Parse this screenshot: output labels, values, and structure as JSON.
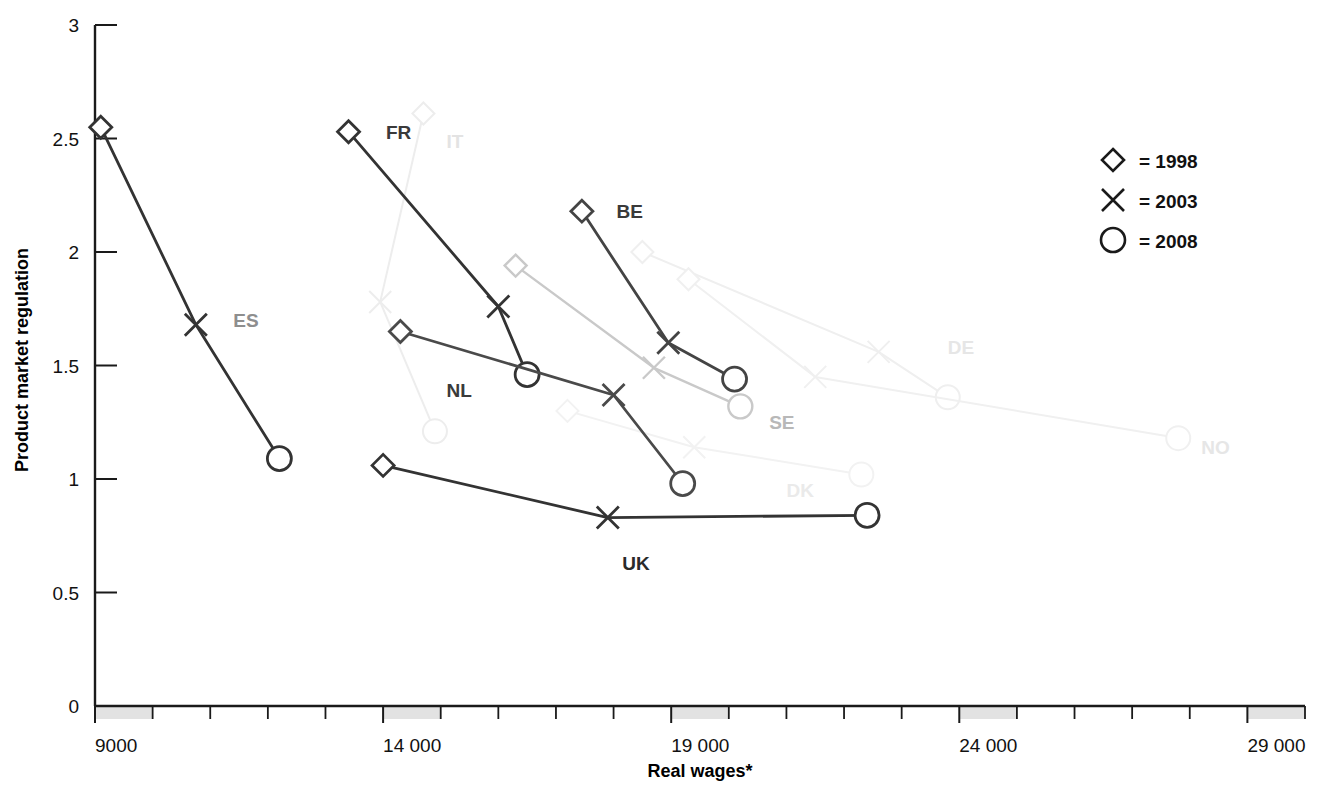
{
  "chart_data": {
    "type": "line",
    "title": "",
    "xlabel": "Real wages*",
    "ylabel": "Product market regulation",
    "xlim": [
      9000,
      30000
    ],
    "ylim": [
      0,
      3
    ],
    "x_ticks_major": [
      9000,
      14000,
      19000,
      24000,
      29000
    ],
    "x_tick_labels": [
      "9000",
      "14 000",
      "19 000",
      "24 000",
      "29 000"
    ],
    "x_tick_step_minor": 1000,
    "y_ticks": [
      0,
      0.5,
      1,
      1.5,
      2,
      2.5,
      3
    ],
    "y_tick_labels": [
      "0",
      "0.5",
      "1",
      "1.5",
      "2",
      "2.5",
      "3"
    ],
    "grid": false,
    "legend_position": "top-right",
    "legend": [
      {
        "marker": "diamond",
        "label": "= 1998"
      },
      {
        "marker": "cross",
        "label": "= 2003"
      },
      {
        "marker": "circle",
        "label": "= 2008"
      }
    ],
    "marker_years": [
      1998,
      2003,
      2008
    ],
    "series": [
      {
        "name": "ES",
        "emphasis": "strong",
        "color": "#333333",
        "label_color": "#8e8e8e",
        "label_pos": {
          "x": 11400,
          "y": 1.7
        },
        "points": [
          {
            "year": 1998,
            "x": 9100,
            "y": 2.55,
            "marker": "diamond"
          },
          {
            "year": 2003,
            "x": 10750,
            "y": 1.68,
            "marker": "cross"
          },
          {
            "year": 2008,
            "x": 12200,
            "y": 1.09,
            "marker": "circle"
          }
        ]
      },
      {
        "name": "FR",
        "emphasis": "strong",
        "color": "#333333",
        "label_color": "#3a3a3a",
        "label_pos": {
          "x": 14050,
          "y": 2.53
        },
        "points": [
          {
            "year": 1998,
            "x": 13400,
            "y": 2.53,
            "marker": "diamond"
          },
          {
            "year": 2003,
            "x": 16000,
            "y": 1.76,
            "marker": "cross"
          },
          {
            "year": 2008,
            "x": 16500,
            "y": 1.46,
            "marker": "circle"
          }
        ]
      },
      {
        "name": "NL",
        "emphasis": "strong",
        "color": "#4a4a4a",
        "label_color": "#3a3a3a",
        "label_pos": {
          "x": 15100,
          "y": 1.39
        },
        "points": [
          {
            "year": 1998,
            "x": 14300,
            "y": 1.65,
            "marker": "diamond"
          },
          {
            "year": 2003,
            "x": 18000,
            "y": 1.37,
            "marker": "cross"
          },
          {
            "year": 2008,
            "x": 19200,
            "y": 0.98,
            "marker": "circle"
          }
        ]
      },
      {
        "name": "BE",
        "emphasis": "strong",
        "color": "#444444",
        "label_color": "#3a3a3a",
        "label_pos": {
          "x": 18050,
          "y": 2.18
        },
        "points": [
          {
            "year": 1998,
            "x": 17450,
            "y": 2.18,
            "marker": "diamond"
          },
          {
            "year": 2003,
            "x": 18950,
            "y": 1.6,
            "marker": "cross"
          },
          {
            "year": 2008,
            "x": 20100,
            "y": 1.44,
            "marker": "circle"
          }
        ]
      },
      {
        "name": "UK",
        "emphasis": "strong",
        "color": "#333333",
        "label_color": "#2a2a2a",
        "label_pos": {
          "x": 18150,
          "y": 0.63
        },
        "points": [
          {
            "year": 1998,
            "x": 14000,
            "y": 1.06,
            "marker": "diamond"
          },
          {
            "year": 2003,
            "x": 17900,
            "y": 0.83,
            "marker": "cross"
          },
          {
            "year": 2008,
            "x": 22400,
            "y": 0.84,
            "marker": "circle"
          }
        ]
      },
      {
        "name": "SE",
        "emphasis": "faint",
        "color": "#c9c9c9",
        "label_color": "#b8b8b8",
        "label_pos": {
          "x": 20700,
          "y": 1.25
        },
        "points": [
          {
            "year": 1998,
            "x": 16300,
            "y": 1.94,
            "marker": "diamond"
          },
          {
            "year": 2003,
            "x": 18700,
            "y": 1.49,
            "marker": "cross"
          },
          {
            "year": 2008,
            "x": 20200,
            "y": 1.32,
            "marker": "circle"
          }
        ]
      },
      {
        "name": "IT",
        "emphasis": "very-faint",
        "color": "#ededed",
        "label_color": "#e3e3e3",
        "label_pos": {
          "x": 15100,
          "y": 2.49
        },
        "points": [
          {
            "year": 1998,
            "x": 14700,
            "y": 2.61,
            "marker": "diamond"
          },
          {
            "year": 2003,
            "x": 13950,
            "y": 1.78,
            "marker": "cross"
          },
          {
            "year": 2008,
            "x": 14900,
            "y": 1.21,
            "marker": "circle"
          }
        ]
      },
      {
        "name": "DE",
        "emphasis": "very-faint",
        "color": "#efefef",
        "label_color": "#e6e6e6",
        "label_pos": {
          "x": 23800,
          "y": 1.58
        },
        "points": [
          {
            "year": 1998,
            "x": 18500,
            "y": 2.0,
            "marker": "diamond"
          },
          {
            "year": 2003,
            "x": 22600,
            "y": 1.56,
            "marker": "cross"
          },
          {
            "year": 2008,
            "x": 23800,
            "y": 1.36,
            "marker": "circle"
          }
        ]
      },
      {
        "name": "NO",
        "emphasis": "very-faint",
        "color": "#f0f0f0",
        "label_color": "#e6e6e6",
        "label_pos": {
          "x": 28200,
          "y": 1.14
        },
        "points": [
          {
            "year": 1998,
            "x": 19300,
            "y": 1.88,
            "marker": "diamond"
          },
          {
            "year": 2003,
            "x": 21500,
            "y": 1.45,
            "marker": "cross"
          },
          {
            "year": 2008,
            "x": 27800,
            "y": 1.18,
            "marker": "circle"
          }
        ]
      },
      {
        "name": "DK",
        "emphasis": "very-faint",
        "color": "#f2f2f2",
        "label_color": "#eaeaea",
        "label_pos": {
          "x": 21000,
          "y": 0.95
        },
        "points": [
          {
            "year": 1998,
            "x": 17200,
            "y": 1.3,
            "marker": "diamond"
          },
          {
            "year": 2003,
            "x": 19400,
            "y": 1.14,
            "marker": "cross"
          },
          {
            "year": 2008,
            "x": 22300,
            "y": 1.02,
            "marker": "circle"
          }
        ]
      }
    ]
  }
}
